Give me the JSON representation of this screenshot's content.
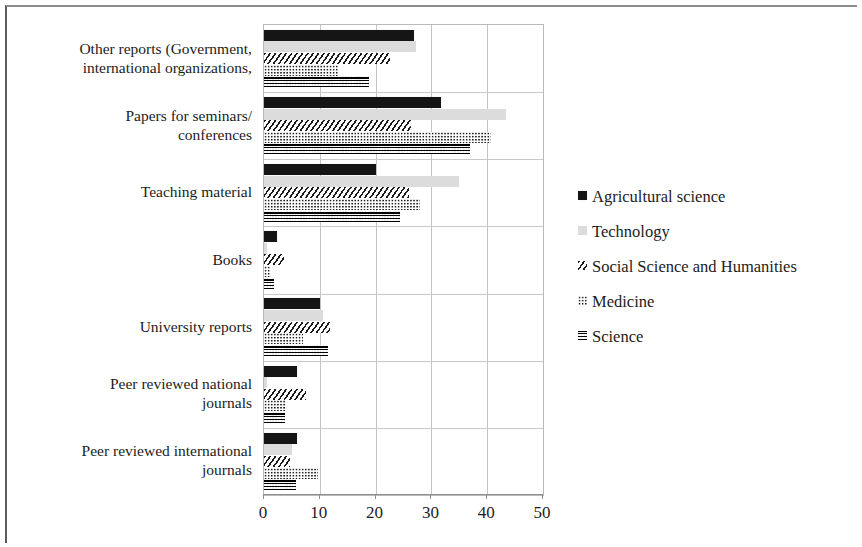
{
  "chart_data": {
    "type": "bar",
    "orientation": "horizontal",
    "title": "",
    "xlabel": "",
    "ylabel": "",
    "xlim": [
      0,
      50
    ],
    "xticks": [
      0,
      10,
      20,
      30,
      40,
      50
    ],
    "grid": "vertical",
    "legend_position": "right",
    "categories": [
      "Peer reviewed international journals",
      "Peer reviewed national journals",
      "University reports",
      "Books",
      "Teaching material",
      "Papers for seminars/ conferences",
      "Other reports (Government, international organizations,"
    ],
    "category_lines": [
      [
        "Peer reviewed international",
        "journals"
      ],
      [
        "Peer reviewed national",
        "journals"
      ],
      [
        "University reports"
      ],
      [
        "Books"
      ],
      [
        "Teaching material"
      ],
      [
        "Papers for seminars/",
        "conferences"
      ],
      [
        "Other reports (Government,",
        "international organizations,"
      ]
    ],
    "series": [
      {
        "name": "Agricultural science",
        "pattern": "solid-black",
        "color": "#151515",
        "values": [
          6,
          6,
          10,
          2.3,
          20,
          31.7,
          26.8
        ]
      },
      {
        "name": "Technology",
        "pattern": "light-gray",
        "color": "#dcdcdc",
        "values": [
          5.1,
          0.5,
          10.5,
          0.5,
          35,
          43.3,
          27.2
        ]
      },
      {
        "name": "Social Science and Humanities",
        "pattern": "diagonal-hatch",
        "color": "#1b1b1b",
        "values": [
          4.6,
          7.6,
          11.8,
          3.6,
          26,
          26.3,
          22.6
        ]
      },
      {
        "name": "Medicine",
        "pattern": "light-dots",
        "color": "#1f1f1f",
        "values": [
          9.6,
          3.9,
          6.9,
          1.3,
          28,
          40.6,
          13.4
        ]
      },
      {
        "name": "Science",
        "pattern": "dense-checker",
        "color": "#2a2a2a",
        "values": [
          5.7,
          3.8,
          11.5,
          1.8,
          24.3,
          37,
          18.8
        ]
      }
    ]
  },
  "legend": {
    "items": [
      {
        "label": "Agricultural science",
        "swatch": "solid-black-swatch"
      },
      {
        "label": "Technology",
        "swatch": "light-gray-swatch"
      },
      {
        "label": "Social Science and Humanities",
        "swatch": "diagonal-hatch-swatch"
      },
      {
        "label": "Medicine",
        "swatch": "light-dots-swatch"
      },
      {
        "label": "Science",
        "swatch": "dense-checker-swatch"
      }
    ]
  },
  "axis": {
    "x_tick_labels": [
      "0",
      "10",
      "20",
      "30",
      "40",
      "50"
    ]
  }
}
